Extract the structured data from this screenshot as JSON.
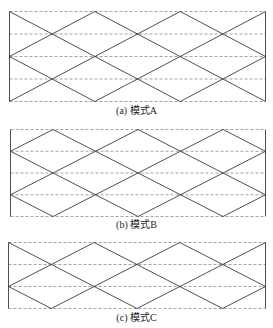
{
  "colors": {
    "solid_line": "#3c3c3c",
    "dashed_line": "#9a9a9a",
    "caption_text": "#222222"
  },
  "figure": {
    "panels": [
      {
        "id": "a",
        "caption": "(a) 模式A",
        "rect": {
          "x": 9,
          "y": 11,
          "w": 256,
          "h": 90
        },
        "caption_y": 105,
        "dashed_rows": [
          0,
          22.5,
          45,
          67.5,
          90
        ],
        "diagonals": [
          [
            0,
            0,
            170.7,
            90
          ],
          [
            85.3,
            0,
            256,
            90
          ],
          [
            170.7,
            0,
            256,
            45
          ],
          [
            0,
            45,
            85.3,
            90
          ],
          [
            0,
            90,
            170.7,
            0
          ],
          [
            85.3,
            90,
            256,
            0
          ],
          [
            0,
            45,
            85.3,
            0
          ],
          [
            170.7,
            90,
            256,
            45
          ]
        ]
      },
      {
        "id": "b",
        "caption": "(b) 模式B",
        "rect": {
          "x": 10,
          "y": 129,
          "w": 255,
          "h": 87
        },
        "caption_y": 219,
        "dashed_rows": [
          0,
          21.75,
          43.5,
          65.25,
          87
        ],
        "diagonals": [
          [
            0,
            21.75,
            127.5,
            87
          ],
          [
            42.5,
            0,
            212.5,
            87
          ],
          [
            127.5,
            0,
            255,
            65.25
          ],
          [
            212.5,
            0,
            255,
            21.75
          ],
          [
            0,
            65.25,
            42.5,
            87
          ],
          [
            0,
            65.25,
            127.5,
            0
          ],
          [
            42.5,
            87,
            212.5,
            0
          ],
          [
            127.5,
            87,
            255,
            21.75
          ],
          [
            212.5,
            87,
            255,
            65.25
          ],
          [
            0,
            21.75,
            42.5,
            0
          ]
        ]
      },
      {
        "id": "c",
        "caption": "(c) 模式C",
        "rect": {
          "x": 8,
          "y": 242,
          "w": 257,
          "h": 66
        },
        "caption_y": 312,
        "dashed_rows": [
          0,
          22,
          44,
          66
        ],
        "diagonals": [
          [
            0,
            0,
            128.5,
            66
          ],
          [
            85.7,
            0,
            214,
            66
          ],
          [
            171.3,
            0,
            257,
            44
          ],
          [
            0,
            44,
            42.8,
            66
          ],
          [
            0,
            44,
            85.7,
            0
          ],
          [
            42.8,
            66,
            171.3,
            0
          ],
          [
            128.5,
            66,
            257,
            0
          ],
          [
            214,
            66,
            257,
            44
          ]
        ]
      }
    ]
  }
}
